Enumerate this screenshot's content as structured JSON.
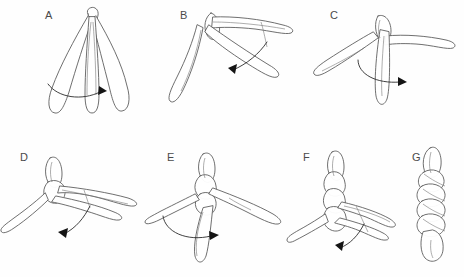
{
  "figure": {
    "background_color": "#fefefe",
    "ink_color": "#555555",
    "label_color": "#4a4a4a",
    "arrow_color": "#141414",
    "width": 464,
    "height": 277,
    "panel_count": 7,
    "rows": 2
  },
  "panels": [
    {
      "id": "A",
      "label": "A",
      "caption": "Three loose strands hanging from a common top knot; curved arrow sweeps right across the lower strands.",
      "label_x": 45,
      "label_y": 15,
      "origin_x": 0,
      "origin_y": 0,
      "arrow": {
        "direction": "right",
        "style": "curved-sweep"
      },
      "strand_count": 3
    },
    {
      "id": "B",
      "label": "B",
      "caption": "Outer strand crossed over; knot at upper left with one strand to the right and one hanging lower left; arrow points down.",
      "label_x": 180,
      "label_y": 15,
      "origin_x": 155,
      "origin_y": 0,
      "arrow": {
        "direction": "down",
        "style": "curved-sweep"
      },
      "strand_count": 3
    },
    {
      "id": "C",
      "label": "C",
      "caption": "Second crossing complete; vertical strand through centre, arrow points right.",
      "label_x": 330,
      "label_y": 15,
      "origin_x": 300,
      "origin_y": 0,
      "arrow": {
        "direction": "right",
        "style": "curved-sweep"
      },
      "strand_count": 3
    },
    {
      "id": "D",
      "label": "D",
      "caption": "Braid building at top; two strands extend to the right, one trails lower left; arrow points down.",
      "label_x": 20,
      "label_y": 153,
      "origin_x": 0,
      "origin_y": 140,
      "arrow": {
        "direction": "down",
        "style": "curved-sweep"
      },
      "strand_count": 3
    },
    {
      "id": "E",
      "label": "E",
      "caption": "Braid tightened further; arrow sweeps right over the crossing strands.",
      "label_x": 167,
      "label_y": 153,
      "origin_x": 145,
      "origin_y": 140,
      "arrow": {
        "direction": "right",
        "style": "curved-sweep"
      },
      "strand_count": 3
    },
    {
      "id": "F",
      "label": "F",
      "caption": "Several plaits completed; remaining tails splay right and lower left; arrow points down.",
      "label_x": 303,
      "label_y": 153,
      "origin_x": 290,
      "origin_y": 140,
      "arrow": {
        "direction": "down",
        "style": "curved-sweep"
      },
      "strand_count": 3
    },
    {
      "id": "G",
      "label": "G",
      "caption": "Finished three-strand braid shown vertically with tucked end.",
      "label_x": 412,
      "label_y": 153,
      "origin_x": 400,
      "origin_y": 140,
      "arrow": null,
      "strand_count": 3
    }
  ]
}
